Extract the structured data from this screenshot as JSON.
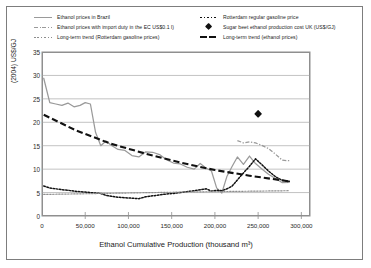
{
  "chart_data": {
    "type": "line",
    "title": "",
    "xlabel": "Ethanol Cumulative Production (thousand m³)",
    "ylabel": "(2004) US$/GJ",
    "xlim": [
      0,
      310000
    ],
    "ylim": [
      0,
      35
    ],
    "xticks": [
      0,
      50000,
      100000,
      150000,
      200000,
      250000,
      300000
    ],
    "xticklabels": [
      "0",
      "50,000",
      "100,000",
      "150,000",
      "200,000",
      "250,000",
      "300,000"
    ],
    "yticks": [
      0,
      5,
      10,
      15,
      20,
      25,
      30,
      35
    ],
    "yticklabels": [
      "0",
      "5",
      "10",
      "15",
      "20",
      "25",
      "30",
      "35"
    ],
    "grid": "horizontal",
    "legend_position": "above-plot",
    "series": [
      {
        "name": "Ethanol prices in Brazil",
        "key_style": "solid",
        "color": "#9a9a9a",
        "points": [
          [
            2000,
            29.4
          ],
          [
            9000,
            24.2
          ],
          [
            16000,
            23.9
          ],
          [
            23000,
            23.6
          ],
          [
            30000,
            24.1
          ],
          [
            37000,
            23.3
          ],
          [
            44000,
            23.6
          ],
          [
            50000,
            24.2
          ],
          [
            56000,
            23.9
          ],
          [
            62000,
            17.8
          ],
          [
            68000,
            15.0
          ],
          [
            74000,
            16.0
          ],
          [
            80000,
            15.1
          ],
          [
            88000,
            14.2
          ],
          [
            96000,
            14.0
          ],
          [
            104000,
            12.9
          ],
          [
            112000,
            12.6
          ],
          [
            120000,
            13.7
          ],
          [
            128000,
            13.6
          ],
          [
            136000,
            13.1
          ],
          [
            144000,
            12.0
          ],
          [
            152000,
            11.3
          ],
          [
            160000,
            11.1
          ],
          [
            168000,
            10.4
          ],
          [
            176000,
            10.0
          ],
          [
            183000,
            11.2
          ],
          [
            190000,
            10.2
          ],
          [
            196000,
            9.6
          ],
          [
            202000,
            6.0
          ],
          [
            208000,
            4.9
          ],
          [
            214000,
            8.5
          ],
          [
            220000,
            10.6
          ],
          [
            226000,
            12.6
          ],
          [
            233000,
            11.0
          ],
          [
            240000,
            12.8
          ],
          [
            247000,
            11.2
          ],
          [
            254000,
            10.1
          ],
          [
            262000,
            8.9
          ],
          [
            270000,
            8.0
          ],
          [
            278000,
            7.1
          ],
          [
            286000,
            7.2
          ]
        ]
      },
      {
        "name": "Ethanol prices with import duty in the EC US$0.1/l)",
        "key_style": "dash-dot",
        "color": "#9a9a9a",
        "points": [
          [
            226000,
            16.1
          ],
          [
            233000,
            15.6
          ],
          [
            240000,
            15.8
          ],
          [
            247000,
            15.6
          ],
          [
            254000,
            15.1
          ],
          [
            262000,
            14.4
          ],
          [
            270000,
            13.2
          ],
          [
            278000,
            11.9
          ],
          [
            286000,
            11.8
          ]
        ]
      },
      {
        "name": "Rotterdam regular gasoline price",
        "key_style": "dotted-black",
        "color": "#111111",
        "points": [
          [
            2000,
            6.4
          ],
          [
            9000,
            6.0
          ],
          [
            16000,
            5.8
          ],
          [
            23000,
            5.6
          ],
          [
            30000,
            5.5
          ],
          [
            37000,
            5.3
          ],
          [
            44000,
            5.2
          ],
          [
            50000,
            5.1
          ],
          [
            56000,
            5.0
          ],
          [
            62000,
            4.9
          ],
          [
            68000,
            4.8
          ],
          [
            74000,
            4.4
          ],
          [
            80000,
            4.2
          ],
          [
            88000,
            4.0
          ],
          [
            96000,
            3.9
          ],
          [
            104000,
            3.8
          ],
          [
            112000,
            3.7
          ],
          [
            120000,
            4.1
          ],
          [
            128000,
            4.3
          ],
          [
            136000,
            4.5
          ],
          [
            144000,
            4.7
          ],
          [
            152000,
            4.8
          ],
          [
            160000,
            5.0
          ],
          [
            168000,
            5.2
          ],
          [
            176000,
            5.4
          ],
          [
            183000,
            5.6
          ],
          [
            190000,
            5.8
          ],
          [
            196000,
            5.3
          ],
          [
            202000,
            5.5
          ],
          [
            208000,
            5.4
          ],
          [
            214000,
            5.8
          ],
          [
            220000,
            6.4
          ],
          [
            226000,
            7.7
          ],
          [
            233000,
            9.2
          ],
          [
            240000,
            10.6
          ],
          [
            247000,
            12.2
          ],
          [
            254000,
            11.0
          ],
          [
            262000,
            9.6
          ],
          [
            270000,
            8.4
          ],
          [
            278000,
            7.6
          ],
          [
            286000,
            7.4
          ]
        ]
      },
      {
        "name": "Long-term trend (Rotterdam gasoline prices)",
        "key_style": "dotted-grey",
        "color": "#8d8d8d",
        "points": [
          [
            2000,
            4.6
          ],
          [
            160000,
            5.1
          ],
          [
            286000,
            5.4
          ]
        ]
      },
      {
        "name": "Long-term trend (ethanol prices)",
        "key_style": "heavy-dashed",
        "color": "#111111",
        "points": [
          [
            2000,
            21.6
          ],
          [
            40000,
            18.2
          ],
          [
            80000,
            15.4
          ],
          [
            120000,
            13.3
          ],
          [
            160000,
            11.4
          ],
          [
            200000,
            9.8
          ],
          [
            240000,
            8.6
          ],
          [
            286000,
            7.4
          ]
        ]
      },
      {
        "name": "Sugar beet ethanol production cost UK (US$/GJ)",
        "key_style": "diamond-marker",
        "color": "#111111",
        "points": [
          [
            250000,
            21.8
          ]
        ]
      }
    ]
  },
  "legend": {
    "items_left": [
      {
        "label": "Ethanol prices in Brazil",
        "key": "solid-line-grey"
      },
      {
        "label": "Ethanol prices with import duty in the EC US$0.1 l)",
        "key": "dash-dot-line-grey"
      },
      {
        "label": "Long-term trend (Rotterdam gasoline prices)",
        "key": "dotted-line-grey"
      }
    ],
    "items_right": [
      {
        "label": "Rotterdam regular gasoline price",
        "key": "dotted-line-black"
      },
      {
        "label": "Sugar beet ethanol production cost UK (US$/GJ)",
        "key": "diamond-marker-black"
      },
      {
        "label": "Long-term trend (ethanol prices)",
        "key": "heavy-dashed-line-black"
      }
    ]
  },
  "colors": {
    "ethanol_brazil": "#9a9a9a",
    "gasoline": "#111111",
    "trend_ethanol": "#111111",
    "trend_gasoline": "#8d8d8d",
    "frame": "#8f8f8f",
    "gridline": "#a8a8a8",
    "border": "#7d7d7d"
  }
}
